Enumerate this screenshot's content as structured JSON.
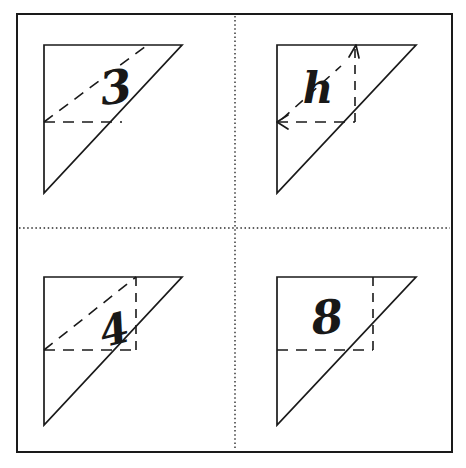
{
  "worksheet": {
    "title": "Right triangle area worksheet",
    "background_color": "#ffffff",
    "ink_color": "#1a1a1a",
    "frame": {
      "name": "outer-border",
      "x": 17,
      "y": 14,
      "width": 435,
      "height": 438,
      "stroke_width": 2
    },
    "dividers": {
      "vertical": {
        "x": 235,
        "y1": 16,
        "y2": 450,
        "style": "dotted"
      },
      "horizontal": {
        "y": 228,
        "x1": 19,
        "x2": 450,
        "style": "dotted"
      }
    },
    "cells": [
      {
        "id": "cell-top-left",
        "position": "top-left",
        "label": "3",
        "label_x": 118,
        "label_y": 100,
        "triangle": {
          "apex_x": 44,
          "top_y": 45,
          "right_x": 182,
          "bottom_y": 193
        },
        "construction_lines": [
          {
            "name": "dashed-diagonal",
            "type": "diagonal",
            "from_x": 44,
            "from_y": 122,
            "to_x": 148,
            "to_y": 45
          },
          {
            "name": "dashed-horizontal",
            "type": "horizontal",
            "from_x": 44,
            "from_y": 122,
            "to_x": 121,
            "to_y": 122
          }
        ],
        "arrows": []
      },
      {
        "id": "cell-top-right",
        "position": "top-right",
        "label": "h",
        "label_x": 318,
        "label_y": 98,
        "triangle": {
          "apex_x": 277,
          "top_y": 45,
          "right_x": 416,
          "bottom_y": 193
        },
        "construction_lines": [
          {
            "name": "dashed-diagonal",
            "type": "diagonal",
            "from_x": 281,
            "from_y": 118,
            "to_x": 340,
            "to_y": 68
          },
          {
            "name": "dashed-horizontal",
            "type": "horizontal",
            "from_x": 277,
            "from_y": 122,
            "to_x": 354,
            "to_y": 122
          },
          {
            "name": "dashed-vertical",
            "type": "vertical",
            "from_x": 354,
            "from_y": 122,
            "to_x": 354,
            "to_y": 45
          }
        ],
        "arrows": [
          {
            "name": "arrow-up",
            "x": 354,
            "y": 45,
            "direction": "up"
          },
          {
            "name": "arrow-left",
            "x": 277,
            "y": 122,
            "direction": "left"
          }
        ]
      },
      {
        "id": "cell-bottom-left",
        "position": "bottom-left",
        "label": "4",
        "label_x": 118,
        "label_y": 338,
        "triangle": {
          "apex_x": 44,
          "top_y": 277,
          "right_x": 182,
          "bottom_y": 425
        },
        "construction_lines": [
          {
            "name": "dashed-diagonal",
            "type": "diagonal",
            "from_x": 44,
            "from_y": 350,
            "to_x": 135,
            "to_y": 277
          },
          {
            "name": "dashed-horizontal",
            "type": "horizontal",
            "from_x": 44,
            "from_y": 350,
            "to_x": 135,
            "to_y": 350
          },
          {
            "name": "dashed-vertical",
            "type": "vertical",
            "from_x": 135,
            "from_y": 350,
            "to_x": 135,
            "to_y": 277
          }
        ],
        "arrows": []
      },
      {
        "id": "cell-bottom-right",
        "position": "bottom-right",
        "label": "8",
        "label_x": 329,
        "label_y": 325,
        "triangle": {
          "apex_x": 277,
          "top_y": 277,
          "right_x": 416,
          "bottom_y": 425
        },
        "construction_lines": [
          {
            "name": "dashed-horizontal",
            "type": "horizontal",
            "from_x": 277,
            "from_y": 350,
            "to_x": 372,
            "to_y": 350
          },
          {
            "name": "dashed-vertical",
            "type": "vertical",
            "from_x": 372,
            "from_y": 350,
            "to_x": 372,
            "to_y": 277
          }
        ],
        "arrows": []
      }
    ]
  }
}
